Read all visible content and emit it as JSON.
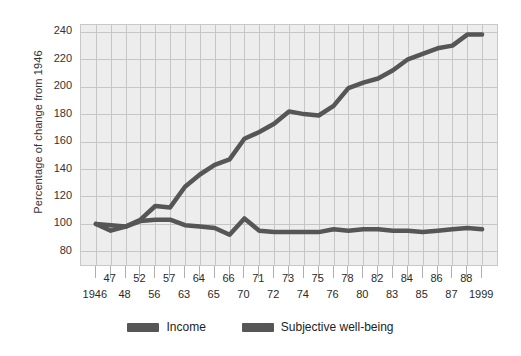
{
  "chart_data": {
    "type": "line",
    "title": "",
    "xlabel": "",
    "ylabel": "Percentage of change from 1946",
    "ylim": [
      70,
      245
    ],
    "yticks": [
      240,
      220,
      200,
      180,
      160,
      140,
      120,
      100,
      80
    ],
    "grid": true,
    "legend_position": "bottom",
    "x": [
      "1946",
      "47",
      "48",
      "52",
      "56",
      "57",
      "63",
      "64",
      "65",
      "66",
      "70",
      "71",
      "72",
      "73",
      "74",
      "75",
      "76",
      "78",
      "80",
      "82",
      "83",
      "84",
      "85",
      "86",
      "87",
      "88",
      "1999"
    ],
    "x_labels_top_row": [
      "47",
      "52",
      "57",
      "64",
      "66",
      "71",
      "73",
      "75",
      "78",
      "82",
      "84",
      "86",
      "88"
    ],
    "x_labels_bottom_row": [
      "1946",
      "48",
      "56",
      "63",
      "65",
      "70",
      "72",
      "74",
      "76",
      "80",
      "83",
      "85",
      "87",
      "1999"
    ],
    "series": [
      {
        "name": "Income",
        "color": "#565656",
        "values": [
          100,
          99,
          98,
          103,
          113,
          112,
          127,
          136,
          143,
          147,
          162,
          167,
          173,
          182,
          180,
          179,
          186,
          199,
          203,
          206,
          212,
          220,
          224,
          228,
          230,
          238,
          238
        ]
      },
      {
        "name": "Subjective well-being",
        "color": "#565656",
        "values": [
          100,
          95,
          98,
          102,
          103,
          103,
          99,
          98,
          97,
          92,
          104,
          95,
          94,
          94,
          94,
          94,
          96,
          95,
          96,
          96,
          95,
          95,
          94,
          95,
          96,
          97,
          96
        ]
      }
    ]
  },
  "legend": {
    "items": [
      {
        "label": "Income",
        "color": "#565656"
      },
      {
        "label": "Subjective well-being",
        "color": "#565656"
      }
    ]
  }
}
